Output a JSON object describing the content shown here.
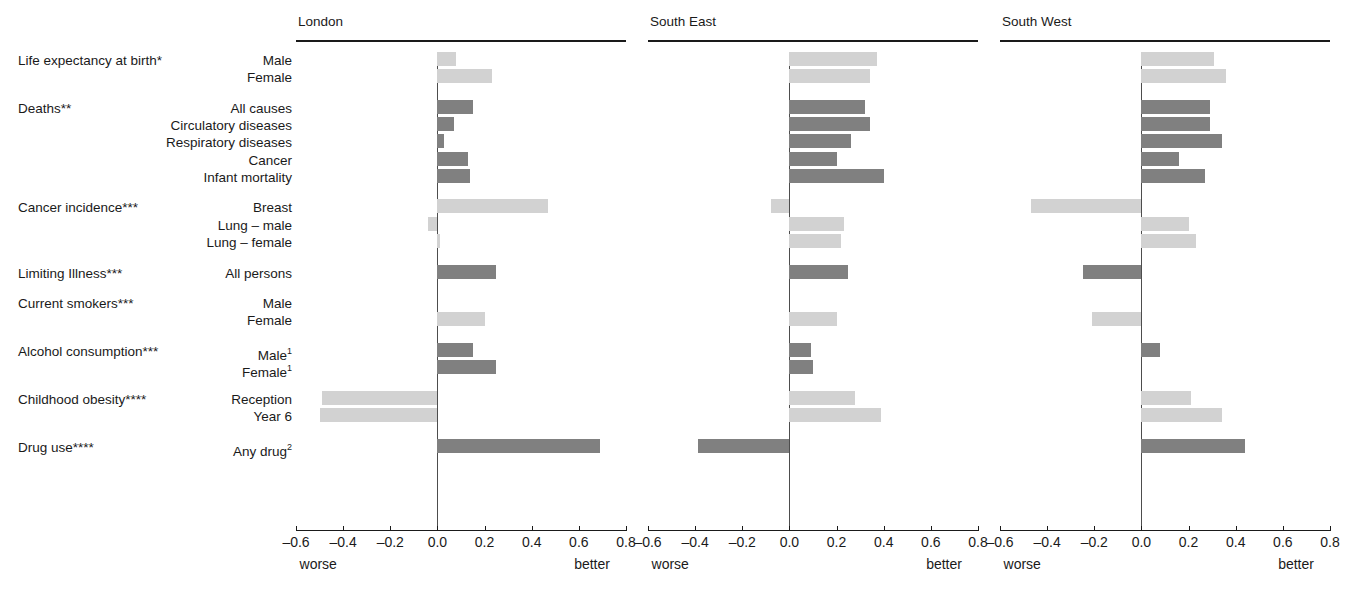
{
  "chart_data": {
    "type": "bar",
    "title": "",
    "orientation": "horizontal",
    "xlabel": "",
    "ylabel": "",
    "xlim": [
      -0.6,
      0.8
    ],
    "xticks": [
      -0.6,
      -0.4,
      -0.2,
      0.0,
      0.2,
      0.4,
      0.6,
      0.8
    ],
    "xtick_labels": [
      "–0.6",
      "–0.4",
      "–0.2",
      "0.0",
      "0.2",
      "0.4",
      "0.6",
      "0.8"
    ],
    "axis_end_labels": {
      "left": "worse",
      "right": "better"
    },
    "grid": false,
    "legend": null,
    "colors": {
      "light_series": "#d2d2d2",
      "dark_series": "#808080",
      "axis": "#1a1a1a",
      "zero_line": "#4d4d4d"
    },
    "panels": [
      "London",
      "South East",
      "South West"
    ],
    "groups": [
      {
        "category": "Life expectancy at birth*",
        "shade": "light",
        "rows": [
          {
            "label": "Male",
            "values": [
              0.08,
              0.37,
              0.31
            ]
          },
          {
            "label": "Female",
            "values": [
              0.23,
              0.34,
              0.36
            ]
          }
        ]
      },
      {
        "category": "Deaths**",
        "shade": "dark",
        "rows": [
          {
            "label": "All causes",
            "values": [
              0.15,
              0.32,
              0.29
            ]
          },
          {
            "label": "Circulatory diseases",
            "values": [
              0.07,
              0.34,
              0.29
            ]
          },
          {
            "label": "Respiratory diseases",
            "values": [
              0.03,
              0.26,
              0.34
            ]
          },
          {
            "label": "Cancer",
            "values": [
              0.13,
              0.2,
              0.16
            ]
          },
          {
            "label": "Infant mortality",
            "values": [
              0.14,
              0.4,
              0.27
            ]
          }
        ]
      },
      {
        "category": "Cancer incidence***",
        "shade": "light",
        "rows": [
          {
            "label": "Breast",
            "values": [
              0.47,
              -0.08,
              -0.47
            ]
          },
          {
            "label": "Lung – male",
            "values": [
              -0.04,
              0.23,
              0.2
            ]
          },
          {
            "label": "Lung – female",
            "values": [
              0.01,
              0.22,
              0.23
            ]
          }
        ]
      },
      {
        "category": "Limiting Illness***",
        "shade": "dark",
        "rows": [
          {
            "label": "All persons",
            "values": [
              0.25,
              0.25,
              -0.25
            ]
          }
        ]
      },
      {
        "category": "Current smokers***",
        "shade": "light",
        "rows": [
          {
            "label": "Male",
            "values": [
              0,
              0,
              0
            ]
          },
          {
            "label": "Female",
            "values": [
              0.2,
              0.2,
              -0.21
            ]
          }
        ]
      },
      {
        "category": "Alcohol consumption***",
        "shade": "dark",
        "rows": [
          {
            "label": "Male",
            "sup": "1",
            "values": [
              0.15,
              0.09,
              0.08
            ]
          },
          {
            "label": "Female",
            "sup": "1",
            "values": [
              0.25,
              0.1,
              0
            ]
          }
        ]
      },
      {
        "category": "Childhood obesity****",
        "shade": "light",
        "rows": [
          {
            "label": "Reception",
            "values": [
              -0.49,
              0.28,
              0.21
            ]
          },
          {
            "label": "Year 6",
            "values": [
              -0.5,
              0.39,
              0.34
            ]
          }
        ]
      },
      {
        "category": "Drug use****",
        "shade": "dark",
        "rows": [
          {
            "label": "Any drug",
            "sup": "2",
            "values": [
              0.69,
              -0.39,
              0.44
            ]
          }
        ]
      }
    ]
  },
  "layout": {
    "panel_left": [
      296,
      648,
      1000
    ],
    "panel_width": 330,
    "label_col_width": 300
  }
}
